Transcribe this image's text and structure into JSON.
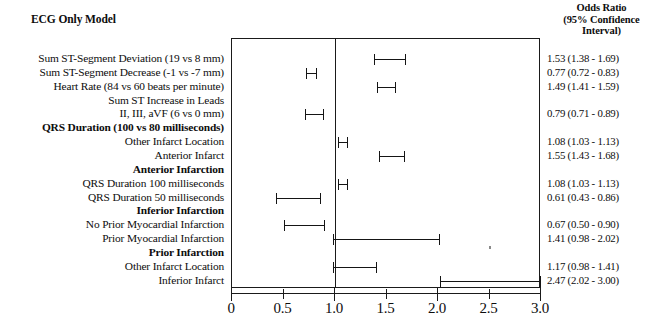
{
  "header": {
    "or_title_line1": "Odds Ratio",
    "or_title_line2": "(95% Confidence",
    "or_title_line3": "Interval)",
    "model_title": "ECG Only Model"
  },
  "axis": {
    "label": "",
    "min": 0,
    "max": 3.0,
    "reference": 1.0,
    "major_ticks": [
      0,
      1.0,
      2.0,
      3.0
    ],
    "minor_ticks": [
      0.5,
      1.5,
      2.5
    ],
    "tick_labels": [
      "0",
      "0.5",
      "1.0",
      "1.5",
      "2.0",
      "2.5",
      "3.0"
    ],
    "tick_values": [
      0,
      0.5,
      1.0,
      1.5,
      2.0,
      2.5,
      3.0
    ]
  },
  "colors": {
    "ink": "#1a1a1a",
    "background": "#ffffff"
  },
  "chart_data": {
    "type": "forest",
    "title": "ECG Only Model",
    "xlabel": "Odds Ratio",
    "ylabel": "",
    "xlim": [
      0,
      3.0
    ],
    "reference_line": 1.0,
    "grid": false,
    "legend": "none",
    "rows": [
      {
        "label": "Sum ST-Segment Deviation (19 vs 8 mm)",
        "style": "plain",
        "indent": 0,
        "or": 1.53,
        "lo": 1.38,
        "hi": 1.69,
        "or_text": "1.53 (1.38 - 1.69)"
      },
      {
        "label": "Sum ST-Segment Decrease (-1 vs -7 mm)",
        "style": "plain",
        "indent": 0,
        "or": 0.77,
        "lo": 0.72,
        "hi": 0.83,
        "or_text": "0.77 (0.72 - 0.83)"
      },
      {
        "label": "Heart Rate (84 vs 60 beats per minute)",
        "style": "plain",
        "indent": 0,
        "or": 1.49,
        "lo": 1.41,
        "hi": 1.59,
        "or_text": "1.49 (1.41 - 1.59)"
      },
      {
        "label": "Sum ST Increase in Leads",
        "style": "plain",
        "indent": 0,
        "or": null,
        "lo": null,
        "hi": null,
        "or_text": ""
      },
      {
        "label": "II, III, aVF (6 vs 0 mm)",
        "style": "plain",
        "indent": 1,
        "or": 0.79,
        "lo": 0.71,
        "hi": 0.89,
        "or_text": "0.79 (0.71 - 0.89)"
      },
      {
        "label": "QRS Duration (100 vs 80 milliseconds)",
        "style": "head",
        "indent": 0,
        "or": null,
        "lo": null,
        "hi": null,
        "or_text": ""
      },
      {
        "label": "Other Infarct Location",
        "style": "plain",
        "indent": 1,
        "or": 1.08,
        "lo": 1.03,
        "hi": 1.13,
        "or_text": "1.08 (1.03 - 1.13)"
      },
      {
        "label": "Anterior Infarct",
        "style": "plain",
        "indent": 1,
        "or": 1.55,
        "lo": 1.43,
        "hi": 1.68,
        "or_text": "1.55 (1.43 - 1.68)"
      },
      {
        "label": "Anterior Infarction",
        "style": "head",
        "indent": 0,
        "or": null,
        "lo": null,
        "hi": null,
        "or_text": ""
      },
      {
        "label": "QRS Duration 100 milliseconds",
        "style": "plain",
        "indent": 1,
        "or": 1.08,
        "lo": 1.03,
        "hi": 1.13,
        "or_text": "1.08 (1.03 - 1.13)"
      },
      {
        "label": "QRS Duration 50 milliseconds",
        "style": "plain",
        "indent": 1,
        "or": 0.61,
        "lo": 0.43,
        "hi": 0.86,
        "or_text": "0.61 (0.43 - 0.86)"
      },
      {
        "label": "Inferior Infarction",
        "style": "head",
        "indent": 0,
        "or": null,
        "lo": null,
        "hi": null,
        "or_text": ""
      },
      {
        "label": "No Prior Myocardial Infarction",
        "style": "plain",
        "indent": 1,
        "or": 0.67,
        "lo": 0.5,
        "hi": 0.9,
        "or_text": "0.67 (0.50 - 0.90)"
      },
      {
        "label": "Prior Myocardial Infarction",
        "style": "plain",
        "indent": 1,
        "or": 1.41,
        "lo": 0.98,
        "hi": 2.02,
        "or_text": "1.41 (0.98 - 2.02)"
      },
      {
        "label": "Prior Infarction",
        "style": "head",
        "indent": 0,
        "or": null,
        "lo": null,
        "hi": null,
        "or_text": ""
      },
      {
        "label": "Other Infarct Location",
        "style": "plain",
        "indent": 1,
        "or": 1.17,
        "lo": 0.98,
        "hi": 1.41,
        "or_text": "1.17 (0.98 - 1.41)"
      },
      {
        "label": "Inferior Infarct",
        "style": "plain",
        "indent": 1,
        "or": 2.47,
        "lo": 2.02,
        "hi": 3.0,
        "or_text": "2.47 (2.02 - 3.00)"
      }
    ]
  }
}
